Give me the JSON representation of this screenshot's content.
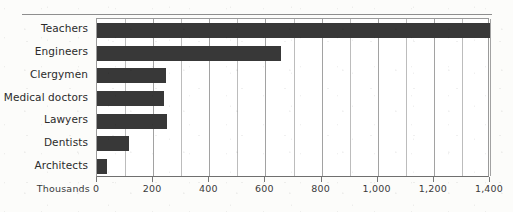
{
  "chart_data": {
    "type": "bar",
    "orientation": "horizontal",
    "title": "",
    "subtitle": "",
    "xlabel": "Thousands",
    "ylabel": "",
    "categories": [
      "Teachers",
      "Engineers",
      "Clergymen",
      "Medical doctors",
      "Lawyers",
      "Dentists",
      "Architects"
    ],
    "values": [
      1400,
      655,
      245,
      240,
      250,
      115,
      35
    ],
    "series": [
      {
        "name": "Number of professionals",
        "values": [
          1400,
          655,
          245,
          240,
          250,
          115,
          35
        ]
      }
    ],
    "xlim": [
      0,
      1400
    ],
    "x_major_ticks": [
      0,
      200,
      400,
      600,
      800,
      1000,
      1200,
      1400
    ],
    "x_major_tick_labels": [
      "0",
      "200",
      "400",
      "600",
      "800",
      "1,000",
      "1,200",
      "1,400"
    ],
    "x_minor_tick_interval": 100,
    "grid": "vertical-only",
    "legend": "none",
    "legend_position": "",
    "annotations": [],
    "bar_color": "#383838",
    "gridline_color": "#bcbcbc",
    "axis_color": "#8e8e8e",
    "plot_background": "#ffffff",
    "page_background": "#fcfcfa"
  },
  "axis": {
    "unit_label": "Thousands"
  }
}
